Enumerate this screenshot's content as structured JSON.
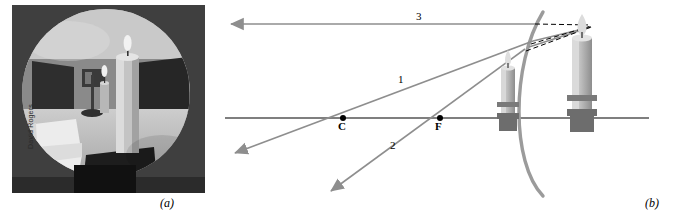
{
  "figure": {
    "panels": [
      {
        "id": "a",
        "label": "(a)",
        "type": "photograph",
        "caption_credit": "David Rogers"
      },
      {
        "id": "b",
        "label": "(b)",
        "type": "ray-diagram"
      }
    ]
  },
  "photo": {
    "description": "Circular convex-mirror photograph of a candle in a room",
    "credit": "David Rogers",
    "background_color": "#4b4b4b",
    "mirror_disc_color": "#b9b9b9"
  },
  "diagram": {
    "axis_label": "principal axis",
    "points": [
      {
        "name": "C",
        "label": "C",
        "x": 343,
        "y": 118
      },
      {
        "name": "F",
        "label": "F",
        "x": 440,
        "y": 118
      }
    ],
    "rays": [
      {
        "name": "ray-3",
        "label": "3",
        "label_x": 416,
        "label_y": 10
      },
      {
        "name": "ray-1",
        "label": "1",
        "label_x": 398,
        "label_y": 73
      },
      {
        "name": "ray-2",
        "label": "2",
        "label_x": 390,
        "label_y": 139
      }
    ],
    "colors": {
      "ray": "#8e8e8e",
      "mirror": "#9b9b9b",
      "axis": "#000000",
      "dashed": "#000000",
      "candle_body": "#b8b8b8",
      "candle_dark": "#6d6d6d",
      "flame": "#d8d8d8"
    },
    "objects": [
      {
        "name": "object-candle",
        "x": 578,
        "y": 115
      },
      {
        "name": "image-candle",
        "x": 508,
        "y": 115
      }
    ],
    "mirror": {
      "name": "convex-mirror",
      "x": 540,
      "top": 12,
      "bottom": 190
    }
  }
}
